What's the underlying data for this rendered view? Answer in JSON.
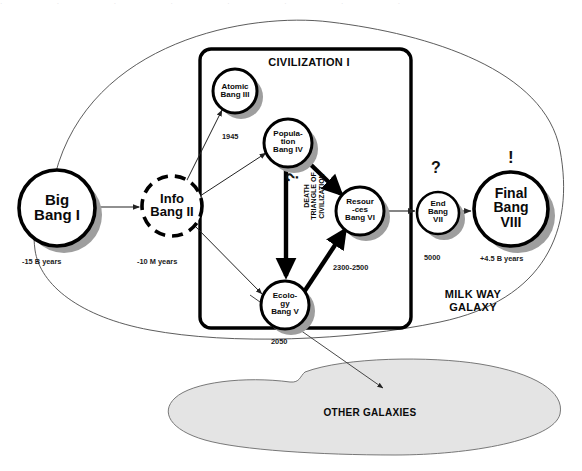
{
  "figure": {
    "civilization_box_label": "CIVILIZATION I",
    "galaxy_label": "MILK WAY\nGALAXY",
    "other_galaxies_label": "OTHER GALAXIES",
    "death_triangle_label": "DEATH\nTRIANGLE OF\nCIVILIZATION",
    "death_triangle_question": "?",
    "colors": {
      "stroke": "#000000",
      "node_fill": "#ffffff",
      "shadow": "#9a9a9a",
      "blob_fill": "#e3e3e3",
      "thin_line": "#3c3c3c",
      "text": "#111111"
    }
  },
  "nodes": [
    {
      "id": "big-bang",
      "label": "Big\nBang I",
      "date": "-15 B years",
      "mark": "",
      "cx": 57,
      "cy": 208,
      "r": 38,
      "font": 15,
      "style": "solid"
    },
    {
      "id": "info-bang",
      "label": "Info\nBang II",
      "date": "-10 M years",
      "mark": "",
      "cx": 172,
      "cy": 206,
      "r": 30,
      "font": 13,
      "style": "dashed"
    },
    {
      "id": "atomic-bang",
      "label": "Atomic\nBang III",
      "date": "1945",
      "mark": "",
      "cx": 235,
      "cy": 91,
      "r": 22,
      "font": 8,
      "style": "solid"
    },
    {
      "id": "population-bang",
      "label": "Popula-\ntion\nBang IV",
      "date": "",
      "mark": "",
      "cx": 288,
      "cy": 143,
      "r": 24,
      "font": 8,
      "style": "solid"
    },
    {
      "id": "ecology-bang",
      "label": "Ecolo-\ngy\nBang V",
      "date": "2050",
      "mark": "",
      "cx": 285,
      "cy": 305,
      "r": 24,
      "font": 8,
      "style": "solid"
    },
    {
      "id": "resources-bang",
      "label": "Resour\n-ces\nBang VI",
      "date": "2300-2500",
      "mark": "",
      "cx": 360,
      "cy": 211,
      "r": 24,
      "font": 8,
      "style": "solid"
    },
    {
      "id": "end-bang",
      "label": "End\nBang\nVII",
      "date": "5000",
      "mark": "?",
      "cx": 438,
      "cy": 213,
      "r": 21,
      "font": 8,
      "style": "solid"
    },
    {
      "id": "final-bang",
      "label": "Final\nBang\nVIII",
      "date": "+4.5 B years",
      "mark": "!",
      "cx": 511,
      "cy": 209,
      "r": 37,
      "font": 14,
      "style": "solid"
    }
  ],
  "date_positions": [
    {
      "id": "date-big-bang",
      "node": "big-bang",
      "x": 22,
      "y": 258
    },
    {
      "id": "date-info-bang",
      "node": "info-bang",
      "x": 139,
      "y": 258
    },
    {
      "id": "date-atomic-bang",
      "node": "atomic-bang",
      "x": 223,
      "y": 136
    },
    {
      "id": "date-resources-bang",
      "node": "resources-bang",
      "x": 333,
      "y": 266
    },
    {
      "id": "date-end-bang",
      "node": "end-bang",
      "x": 424,
      "y": 257
    },
    {
      "id": "date-final-bang",
      "node": "final-bang",
      "x": 480,
      "y": 258
    },
    {
      "id": "date-ecology-bang",
      "node": "ecology-bang",
      "x": 272,
      "y": 343
    }
  ],
  "marks": [
    {
      "id": "mark-end-bang",
      "text": "?",
      "x": 432,
      "y": 168,
      "size": 16
    },
    {
      "id": "mark-final-bang",
      "text": "!",
      "x": 506,
      "y": 157,
      "size": 17
    }
  ],
  "labels": {
    "civilization": {
      "text": "CIVILIZATION I",
      "x": 274,
      "y": 63,
      "size": 11
    },
    "milk_way": {
      "text": "MILK WAY\nGALAXY",
      "x": 395,
      "y": 295,
      "size": 11
    },
    "other_galaxies": {
      "text": "OTHER GALAXIES",
      "x": 362,
      "y": 414,
      "size": 10
    },
    "death_triangle": {
      "text": "DEATH\nTRIANGLE OF\nCIVILIZATION",
      "x": 300,
      "y": 215,
      "size": 7
    },
    "death_question": {
      "text": "?",
      "x": 293,
      "y": 178,
      "size": 16
    }
  }
}
